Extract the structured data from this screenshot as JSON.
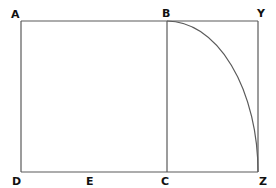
{
  "diagram": {
    "stroke_color": "#555555",
    "label_color": "#111111",
    "labels": {
      "A": "A",
      "B": "B",
      "Y": "Y",
      "D": "D",
      "E": "E",
      "C": "C",
      "Z": "Z"
    },
    "points": {
      "A": [
        21,
        21
      ],
      "B": [
        167,
        21
      ],
      "Y": [
        258,
        21
      ],
      "D": [
        21,
        172
      ],
      "E": [
        91,
        172
      ],
      "C": [
        167,
        172
      ],
      "Z": [
        258,
        172
      ]
    },
    "segments": [
      "AY",
      "DZ",
      "AD",
      "BC",
      "YZ"
    ],
    "arcs": [
      {
        "from": "B",
        "to": "Z",
        "center": "C"
      }
    ]
  }
}
